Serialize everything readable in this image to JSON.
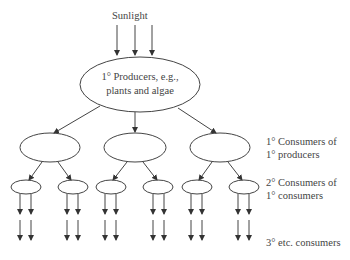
{
  "diagram": {
    "source_label": "Sunlight",
    "producer_label_line1": "1° Producers, e.g.,",
    "producer_label_line2": "plants and algae",
    "levels": [
      {
        "label_line1": "1° Consumers of",
        "label_line2": "1° producers"
      },
      {
        "label_line1": "2° Consumers of",
        "label_line2": "1° consumers"
      },
      {
        "label_line1": "3° etc. consumers",
        "label_line2": ""
      }
    ],
    "colors": {
      "stroke": "#444444",
      "text": "#444444",
      "background": "#ffffff"
    }
  }
}
